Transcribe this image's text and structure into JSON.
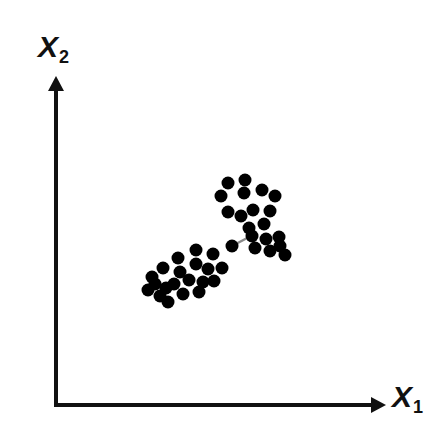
{
  "figure": {
    "width": 443,
    "height": 440,
    "background": "#ffffff",
    "ink_color": "#111111",
    "point_color": "#000000",
    "bridge_color": "#8a8a8a"
  },
  "axes": {
    "x": {
      "label_base": "X",
      "label_sub": "1",
      "origin_x": 56,
      "origin_y": 405,
      "end_x": 384,
      "end_y": 405,
      "arrow": "arrowhead-right"
    },
    "y": {
      "label_base": "X",
      "label_sub": "2",
      "origin_x": 56,
      "origin_y": 405,
      "end_x": 56,
      "end_y": 78,
      "arrow": "arrowhead-up"
    },
    "line_width": 4
  },
  "chart_data": {
    "type": "scatter",
    "title": "",
    "xlabel": "X1",
    "ylabel": "X2",
    "grid": false,
    "legend": false,
    "axis_style": "arrow-axes-no-ticks",
    "xlim": [
      56,
      384
    ],
    "ylim": [
      78,
      405
    ],
    "marker": {
      "shape": "circle",
      "diameter_px": 13,
      "color": "#000000",
      "filled": true
    },
    "series": [
      {
        "name": "cluster-upper-right",
        "color": "#000000",
        "n_points": 19,
        "points": [
          [
            228,
            183
          ],
          [
            245,
            180
          ],
          [
            244,
            193
          ],
          [
            262,
            190
          ],
          [
            221,
            196
          ],
          [
            275,
            196
          ],
          [
            228,
            212
          ],
          [
            241,
            216
          ],
          [
            253,
            210
          ],
          [
            270,
            211
          ],
          [
            249,
            228
          ],
          [
            264,
            224
          ],
          [
            266,
            239
          ],
          [
            279,
            237
          ],
          [
            252,
            236
          ],
          [
            255,
            248
          ],
          [
            270,
            251
          ],
          [
            280,
            246
          ],
          [
            285,
            255
          ]
        ]
      },
      {
        "name": "cluster-lower-left",
        "color": "#000000",
        "n_points": 21,
        "points": [
          [
            196,
            250
          ],
          [
            178,
            258
          ],
          [
            232,
            246
          ],
          [
            213,
            254
          ],
          [
            163,
            268
          ],
          [
            196,
            264
          ],
          [
            180,
            272
          ],
          [
            208,
            269
          ],
          [
            222,
            268
          ],
          [
            152,
            277
          ],
          [
            174,
            284
          ],
          [
            189,
            280
          ],
          [
            203,
            282
          ],
          [
            148,
            290
          ],
          [
            166,
            288
          ],
          [
            183,
            294
          ],
          [
            199,
            292
          ],
          [
            214,
            281
          ],
          [
            160,
            296
          ],
          [
            168,
            302
          ],
          [
            155,
            284
          ]
        ]
      }
    ],
    "connectors": [
      {
        "name": "single-linkage-bridge",
        "from": [
          232,
          246
        ],
        "to": [
          251,
          236
        ],
        "color": "#8a8a8a",
        "width": 2.5
      }
    ]
  }
}
